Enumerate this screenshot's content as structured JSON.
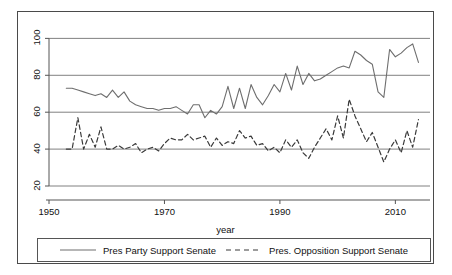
{
  "chart_data": {
    "type": "line",
    "title": "",
    "xlabel": "year",
    "ylabel": "",
    "xlim": [
      1950,
      2016
    ],
    "ylim": [
      20,
      104
    ],
    "xticks": [
      1950,
      1970,
      1990,
      2010
    ],
    "yticks": [
      20,
      40,
      60,
      80,
      100
    ],
    "grid": true,
    "grid_axis": "y",
    "legend_position": "bottom",
    "x": [
      1953,
      1954,
      1955,
      1956,
      1957,
      1958,
      1959,
      1960,
      1961,
      1962,
      1963,
      1964,
      1965,
      1966,
      1967,
      1968,
      1969,
      1970,
      1971,
      1972,
      1973,
      1974,
      1975,
      1976,
      1977,
      1978,
      1979,
      1980,
      1981,
      1982,
      1983,
      1984,
      1985,
      1986,
      1987,
      1988,
      1989,
      1990,
      1991,
      1992,
      1993,
      1994,
      1995,
      1996,
      1997,
      1998,
      1999,
      2000,
      2001,
      2002,
      2003,
      2004,
      2005,
      2006,
      2007,
      2008,
      2009,
      2010,
      2011,
      2012,
      2013,
      2014
    ],
    "series": [
      {
        "name": "Pres Party Support Senate",
        "style": "solid",
        "color": "#6e6e6e",
        "values": [
          73,
          73,
          72,
          71,
          70,
          69,
          70,
          68,
          72,
          68,
          71,
          66,
          64,
          63,
          62,
          62,
          61,
          62,
          62,
          63,
          61,
          59,
          64,
          64,
          57,
          61,
          59,
          63,
          74,
          62,
          73,
          62,
          75,
          68,
          64,
          69,
          75,
          71,
          81,
          72,
          85,
          75,
          81,
          77,
          78,
          80,
          82,
          84,
          85,
          84,
          93,
          91,
          88,
          86,
          71,
          68,
          94,
          90,
          92,
          95,
          97,
          87
        ]
      },
      {
        "name": "Pres. Opposition Support Senate",
        "style": "dashed",
        "color": "#3a3a3a",
        "values": [
          40,
          40,
          57,
          40,
          48,
          41,
          52,
          40,
          40,
          42,
          40,
          41,
          43,
          38,
          40,
          41,
          39,
          43,
          46,
          45,
          45,
          48,
          45,
          46,
          47,
          41,
          46,
          42,
          44,
          43,
          50,
          46,
          47,
          42,
          43,
          39,
          41,
          38,
          45,
          41,
          45,
          38,
          35,
          41,
          46,
          51,
          45,
          58,
          46,
          67,
          58,
          51,
          44,
          49,
          41,
          33,
          40,
          45,
          38,
          50,
          41,
          56
        ]
      }
    ]
  },
  "axes": {
    "ytick_labels": [
      "100",
      "80",
      "60",
      "40",
      "20"
    ],
    "xtick_labels": [
      "1950",
      "1970",
      "1990",
      "2010"
    ],
    "xaxis_title": "year"
  },
  "legend": {
    "entries": [
      {
        "label": "Pres Party Support Senate",
        "style": "solid"
      },
      {
        "label": "Pres. Opposition Support Senate",
        "style": "dashed"
      }
    ]
  },
  "colors": {
    "solid_series": "#6e6e6e",
    "dashed_series": "#3a3a3a",
    "grid": "#808080",
    "axis": "#555555",
    "border": "#4a4a4a"
  }
}
